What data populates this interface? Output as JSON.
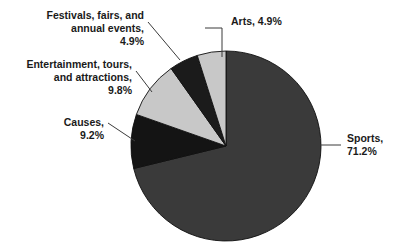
{
  "chart_data": {
    "type": "pie",
    "title": "",
    "subtitle": "",
    "xlabel": "",
    "ylabel": "",
    "legend_position": "none",
    "grid": false,
    "units": "percent",
    "total": 100.0,
    "categories": [
      "Sports",
      "Arts",
      "Festivals, fairs, and annual events",
      "Entertainment, tours, and attractions",
      "Causes"
    ],
    "values": [
      71.2,
      4.9,
      4.9,
      9.8,
      9.2
    ],
    "slices": [
      {
        "name": "Sports",
        "value": 71.2,
        "value_text": "71.2%",
        "color": "#3a3a3a",
        "label_lines": [
          "Sports,",
          "71.2%"
        ],
        "label_position": "right",
        "start_angle_deg": 0,
        "end_angle_deg": 256.3
      },
      {
        "name": "Causes",
        "value": 9.2,
        "value_text": "9.2%",
        "color": "#141414",
        "label_lines": [
          "Causes,",
          "9.2%"
        ],
        "label_position": "left",
        "start_angle_deg": 256.3,
        "end_angle_deg": 289.4
      },
      {
        "name": "Entertainment, tours, and attractions",
        "value": 9.8,
        "value_text": "9.8%",
        "color": "#c8c8c8",
        "label_lines": [
          "Entertainment, tours,",
          "and attractions,",
          "9.8%"
        ],
        "label_position": "left",
        "start_angle_deg": 289.4,
        "end_angle_deg": 324.7
      },
      {
        "name": "Festivals, fairs, and annual events",
        "value": 4.9,
        "value_text": "4.9%",
        "color": "#1b1b1b",
        "label_lines": [
          "Festivals, fairs, and",
          "annual events,",
          "4.9%"
        ],
        "label_position": "left",
        "start_angle_deg": 324.7,
        "end_angle_deg": 342.4
      },
      {
        "name": "Arts",
        "value": 4.9,
        "value_text": "4.9%",
        "color": "#c8c8c8",
        "label_lines": [
          "Arts, 4.9%"
        ],
        "label_position": "top",
        "start_angle_deg": 342.4,
        "end_angle_deg": 360
      }
    ]
  },
  "labels": {
    "arts": "Arts, 4.9%",
    "festivals_line1": "Festivals, fairs, and",
    "festivals_line2": "annual events,",
    "festivals_line3": "4.9%",
    "entertainment_line1": "Entertainment, tours,",
    "entertainment_line2": "and attractions,",
    "entertainment_line3": "9.8%",
    "causes_line1": "Causes,",
    "causes_line2": "9.2%",
    "sports_line1": "Sports,",
    "sports_line2": "71.2%"
  },
  "colors": {
    "sports": "#3a3a3a",
    "causes": "#141414",
    "entertainment": "#c8c8c8",
    "festivals": "#1b1b1b",
    "arts": "#c8c8c8",
    "outline": "#101010",
    "leader": "#3b3b3b",
    "text": "#1a1a1a",
    "background": "#ffffff"
  }
}
